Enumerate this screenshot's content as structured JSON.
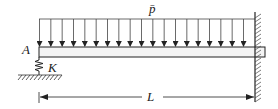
{
  "diagram": {
    "load_label": "p̄",
    "point_label": "A",
    "spring_label": "K",
    "length_label": "L",
    "arrow_count": 19,
    "colors": {
      "line": "#222222",
      "beam_fill": "#f4f4f4"
    }
  }
}
